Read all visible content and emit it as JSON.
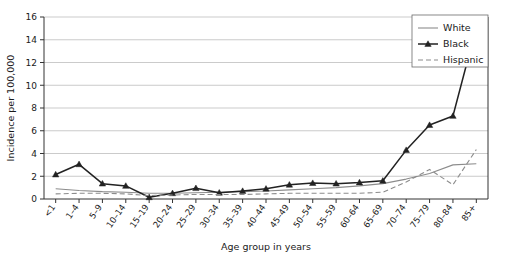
{
  "chart_data": {
    "type": "line",
    "title": "",
    "xlabel": "Age group in years",
    "ylabel": "Incidence per 100,000",
    "ylim": [
      0,
      16
    ],
    "yticks": [
      0,
      2,
      4,
      6,
      8,
      10,
      12,
      14,
      16
    ],
    "grid": true,
    "legend_position": "top-right",
    "categories": [
      "<1",
      "1–4",
      "5–9",
      "10–14",
      "15–19",
      "20–24",
      "25–29",
      "30–34",
      "35–39",
      "40–44",
      "45–49",
      "50–54",
      "55–59",
      "60–64",
      "65–69",
      "70–74",
      "75–79",
      "80–84",
      "85+"
    ],
    "series": [
      {
        "name": "White",
        "color": "#8c8c8c",
        "style": "solid",
        "marker": "none",
        "values": [
          0.9,
          0.75,
          0.65,
          0.6,
          0.5,
          0.5,
          0.55,
          0.6,
          0.65,
          0.7,
          0.8,
          0.9,
          1.0,
          1.15,
          1.35,
          1.75,
          2.25,
          3.0,
          3.1
        ]
      },
      {
        "name": "Black",
        "color": "#222222",
        "style": "solid",
        "marker": "triangle",
        "values": [
          2.15,
          3.05,
          1.35,
          1.15,
          0.15,
          0.5,
          0.95,
          0.55,
          0.7,
          0.9,
          1.25,
          1.4,
          1.35,
          1.45,
          1.6,
          4.3,
          6.5,
          7.3,
          15.1
        ]
      },
      {
        "name": "Hispanic",
        "color": "#8c8c8c",
        "style": "dashed",
        "marker": "none",
        "values": [
          0.45,
          0.5,
          0.5,
          0.45,
          0.3,
          0.35,
          0.4,
          0.4,
          0.4,
          0.45,
          0.5,
          0.5,
          0.5,
          0.5,
          0.6,
          1.5,
          2.6,
          1.25,
          4.35
        ]
      }
    ]
  },
  "legend": {
    "entries": [
      {
        "label": "White"
      },
      {
        "label": "Black"
      },
      {
        "label": "Hispanic"
      }
    ]
  }
}
